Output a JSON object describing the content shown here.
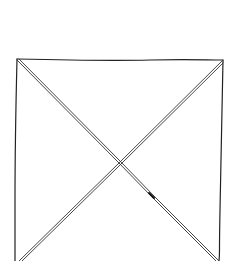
{
  "diagram": {
    "type": "image-placeholder-wireframe",
    "description": "Hand-drawn square with an X through it",
    "stroke_color": "#222222",
    "background_color": "#ffffff",
    "box": {
      "left": 15,
      "top": 59,
      "right": 223,
      "bottom": 261
    },
    "crossing_point": {
      "x": 118,
      "y": 163
    }
  }
}
